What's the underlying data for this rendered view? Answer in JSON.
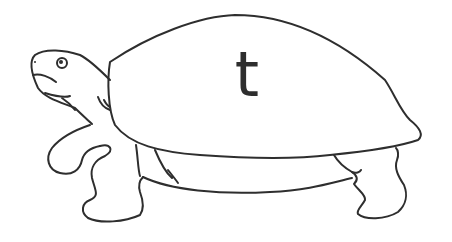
{
  "image": {
    "subject": "turtle outline drawing",
    "shell_letter": "t",
    "line_color": "#2e2e2e",
    "background": "#ffffff"
  }
}
